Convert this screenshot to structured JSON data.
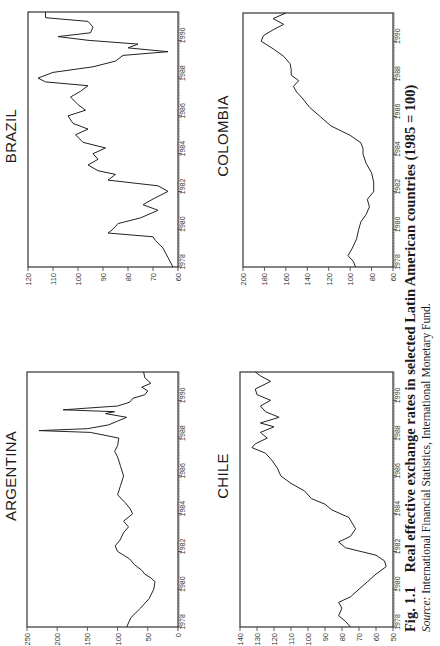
{
  "figure": {
    "label": "Fig. 1.1",
    "title": "Real effective exchange rates in selected Latin American countries (1985 = 100)",
    "source_label": "Source:",
    "source_text": " International Financial Statistics, International Monetary Fund."
  },
  "chart_data": [
    {
      "type": "line",
      "title": "ARGENTINA",
      "xlabel": "",
      "ylabel": "",
      "xlim": [
        1978,
        1991.5
      ],
      "ylim": [
        0,
        250
      ],
      "yticks": [
        0,
        50,
        100,
        150,
        200,
        250
      ],
      "xticks": [
        1978,
        1980,
        1982,
        1984,
        1986,
        1988,
        1990
      ],
      "grid": false,
      "x": [
        1978.0,
        1978.5,
        1979.0,
        1979.5,
        1980.0,
        1980.4,
        1980.6,
        1980.8,
        1981.0,
        1981.3,
        1981.6,
        1982.0,
        1982.3,
        1982.6,
        1983.0,
        1983.3,
        1983.6,
        1984.0,
        1984.3,
        1984.6,
        1985.0,
        1985.5,
        1986.0,
        1986.5,
        1987.0,
        1987.3,
        1987.6,
        1988.0,
        1988.3,
        1988.4,
        1988.5,
        1988.7,
        1988.9,
        1989.1,
        1989.3,
        1989.4,
        1989.5,
        1989.7,
        1989.9,
        1990.1,
        1990.3,
        1990.5,
        1990.7,
        1990.9,
        1991.2,
        1991.5
      ],
      "values": [
        85,
        78,
        62,
        48,
        40,
        38,
        45,
        55,
        60,
        72,
        80,
        100,
        104,
        96,
        90,
        82,
        90,
        75,
        80,
        88,
        100,
        95,
        90,
        95,
        100,
        105,
        100,
        98,
        145,
        230,
        150,
        115,
        100,
        85,
        120,
        105,
        190,
        100,
        80,
        75,
        55,
        50,
        60,
        45,
        55,
        57
      ]
    },
    {
      "type": "line",
      "title": "BRAZIL",
      "xlabel": "",
      "ylabel": "",
      "xlim": [
        1978,
        1991.5
      ],
      "ylim": [
        60,
        120
      ],
      "yticks": [
        60,
        70,
        80,
        90,
        100,
        110,
        120
      ],
      "xticks": [
        1978,
        1980,
        1982,
        1984,
        1986,
        1988,
        1990
      ],
      "grid": false,
      "x": [
        1978.0,
        1978.5,
        1979.0,
        1979.4,
        1979.6,
        1979.8,
        1980.0,
        1980.3,
        1980.6,
        1981.0,
        1981.3,
        1981.6,
        1982.0,
        1982.3,
        1982.6,
        1982.9,
        1983.1,
        1983.4,
        1983.7,
        1984.0,
        1984.3,
        1984.6,
        1985.0,
        1985.3,
        1985.6,
        1986.0,
        1986.3,
        1986.6,
        1987.0,
        1987.3,
        1987.6,
        1987.8,
        1988.0,
        1988.3,
        1988.6,
        1988.9,
        1989.2,
        1989.4,
        1989.6,
        1989.8,
        1990.0,
        1990.2,
        1990.4,
        1990.7,
        1991.0,
        1991.2,
        1991.5
      ],
      "values": [
        62,
        64,
        66,
        69,
        70,
        88,
        86,
        84,
        75,
        68,
        74,
        70,
        64,
        68,
        88,
        85,
        92,
        96,
        92,
        94,
        89,
        98,
        101,
        96,
        102,
        104,
        97,
        100,
        103,
        99,
        96,
        113,
        116,
        110,
        94,
        85,
        82,
        64,
        80,
        76,
        96,
        108,
        95,
        94,
        96,
        113,
        113
      ]
    },
    {
      "type": "line",
      "title": "CHILE",
      "xlabel": "",
      "ylabel": "",
      "xlim": [
        1978,
        1991.5
      ],
      "ylim": [
        50,
        140
      ],
      "yticks": [
        50,
        60,
        70,
        80,
        90,
        100,
        110,
        120,
        130,
        140
      ],
      "xticks": [
        1978,
        1980,
        1982,
        1984,
        1986,
        1988,
        1990
      ],
      "grid": false,
      "x": [
        1978.0,
        1978.3,
        1978.6,
        1979.0,
        1979.3,
        1979.6,
        1980.0,
        1980.4,
        1980.8,
        1981.2,
        1981.5,
        1981.8,
        1982.2,
        1982.5,
        1982.8,
        1983.2,
        1983.5,
        1983.8,
        1984.2,
        1984.5,
        1984.8,
        1985.2,
        1985.6,
        1986.0,
        1986.4,
        1986.8,
        1987.2,
        1987.5,
        1987.7,
        1988.0,
        1988.3,
        1988.6,
        1988.8,
        1989.1,
        1989.4,
        1989.7,
        1990.0,
        1990.3,
        1990.6,
        1991.0,
        1991.3,
        1991.5
      ],
      "values": [
        75,
        78,
        82,
        80,
        82,
        75,
        70,
        65,
        60,
        54,
        55,
        60,
        78,
        82,
        75,
        72,
        74,
        76,
        86,
        90,
        98,
        102,
        110,
        116,
        118,
        121,
        125,
        133,
        131,
        124,
        128,
        120,
        128,
        117,
        125,
        128,
        122,
        130,
        131,
        122,
        128,
        131
      ]
    },
    {
      "type": "line",
      "title": "COLOMBIA",
      "xlabel": "",
      "ylabel": "",
      "xlim": [
        1978,
        1991.5
      ],
      "ylim": [
        60,
        200
      ],
      "yticks": [
        60,
        80,
        100,
        120,
        140,
        160,
        180,
        200
      ],
      "xticks": [
        1978,
        1980,
        1982,
        1984,
        1986,
        1988,
        1990
      ],
      "grid": false,
      "x": [
        1978.0,
        1978.3,
        1978.6,
        1979.0,
        1979.5,
        1980.0,
        1980.4,
        1980.8,
        1981.2,
        1981.6,
        1982.0,
        1982.5,
        1983.0,
        1983.5,
        1984.0,
        1984.3,
        1984.6,
        1985.0,
        1985.5,
        1986.0,
        1986.5,
        1987.0,
        1987.3,
        1987.6,
        1987.9,
        1988.2,
        1988.5,
        1988.8,
        1989.2,
        1989.6,
        1990.0,
        1990.3,
        1990.6,
        1990.9,
        1991.2,
        1991.5
      ],
      "values": [
        95,
        97,
        102,
        98,
        94,
        92,
        90,
        85,
        82,
        84,
        78,
        78,
        80,
        85,
        88,
        88,
        90,
        100,
        118,
        128,
        138,
        145,
        150,
        153,
        148,
        155,
        155,
        156,
        162,
        172,
        183,
        181,
        172,
        162,
        172,
        160
      ]
    }
  ]
}
